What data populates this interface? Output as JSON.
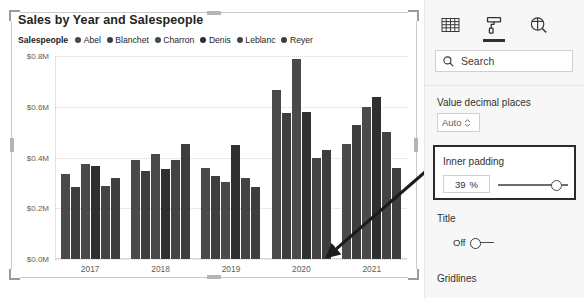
{
  "visual": {
    "title": "Sales by Year and Salespeople",
    "selected": true
  },
  "chart_data": {
    "type": "bar",
    "title": "Sales by Year and Salespeople",
    "xlabel": "",
    "ylabel": "",
    "legend_title": "Salespeople",
    "legend_position": "top",
    "grid": true,
    "ylim": [
      0,
      0.8
    ],
    "ytick_labels": [
      "$0.8M",
      "$0.6M",
      "$0.4M",
      "$0.2M",
      "$0.0M"
    ],
    "ytick_values": [
      0.8,
      0.6,
      0.4,
      0.2,
      0.0
    ],
    "categories": [
      "2017",
      "2018",
      "2019",
      "2020",
      "2021"
    ],
    "series": [
      {
        "name": "Abel",
        "color": "#4a4a4a",
        "values": [
          0.335,
          0.392,
          0.36,
          0.665,
          0.455
        ]
      },
      {
        "name": "Blanchet",
        "color": "#3e3e3e",
        "values": [
          0.285,
          0.345,
          0.327,
          0.575,
          0.53
        ]
      },
      {
        "name": "Charron",
        "color": "#4a4a4a",
        "values": [
          0.375,
          0.415,
          0.302,
          0.79,
          0.6
        ]
      },
      {
        "name": "Denis",
        "color": "#2f2f2f",
        "values": [
          0.368,
          0.355,
          0.448,
          0.58,
          0.64
        ]
      },
      {
        "name": "Leblanc",
        "color": "#444444",
        "values": [
          0.288,
          0.39,
          0.318,
          0.4,
          0.5
        ]
      },
      {
        "name": "Reyer",
        "color": "#3e3e3e",
        "values": [
          0.318,
          0.452,
          0.285,
          0.43,
          0.36
        ]
      }
    ]
  },
  "format_pane": {
    "tabs": [
      {
        "id": "fields",
        "icon": "table-grid-icon",
        "active": false
      },
      {
        "id": "format",
        "icon": "paint-roller-icon",
        "active": true
      },
      {
        "id": "analytics",
        "icon": "analytics-magnifier-icon",
        "active": false
      }
    ],
    "search": {
      "placeholder": "Search",
      "value": "Search",
      "icon": "search-icon"
    },
    "value_decimal_places": {
      "label": "Value decimal places",
      "value": "Auto"
    },
    "inner_padding": {
      "label": "Inner padding",
      "value": "39",
      "unit": "%",
      "highlighted": true
    },
    "title_section": {
      "label": "Title",
      "toggle_state": "Off"
    },
    "gridlines_section": {
      "label": "Gridlines"
    }
  },
  "annotation": {
    "type": "arrow",
    "from": "inner-padding-setting",
    "to": "chart-bars"
  }
}
